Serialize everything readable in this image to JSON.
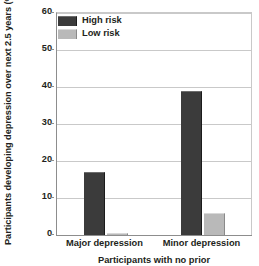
{
  "chart_data": {
    "type": "bar",
    "title": "",
    "categories": [
      "Major depression",
      "Minor depression"
    ],
    "series": [
      {
        "name": "High risk",
        "values": [
          17,
          39
        ],
        "color": "#3b3b3b"
      },
      {
        "name": "Low risk",
        "values": [
          0.6,
          6
        ],
        "color": "#b9b9b9"
      }
    ],
    "xlabel": "Participants with no prior",
    "ylabel": "Participants developing depression over next 2.5 years (%)",
    "ylim": [
      0,
      60
    ],
    "ytick_labels": [
      "0",
      "10",
      "20",
      "30",
      "40",
      "50",
      "60"
    ],
    "ytick_values": [
      0,
      10,
      20,
      30,
      40,
      50,
      60
    ],
    "grid": true,
    "legend_position": "top-left"
  },
  "legend": {
    "entries": [
      {
        "label": "High risk"
      },
      {
        "label": "Low risk"
      }
    ]
  }
}
